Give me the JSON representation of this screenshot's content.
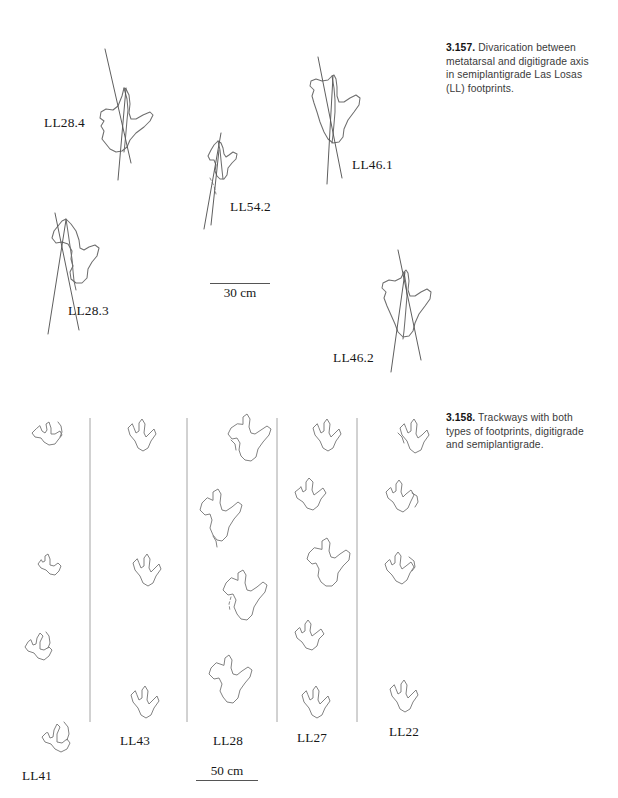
{
  "figure": {
    "caption_3157": {
      "number": "3.157.",
      "text": "Divarication between metatarsal and digitigrade axis in semiplantigrade Las Losas (LL) footprints."
    },
    "caption_3158": {
      "number": "3.158.",
      "text": "Trackways with both types of footprints, digitigrade and semiplantigrade."
    }
  },
  "panel_top": {
    "specimens": [
      {
        "label": "LL28.4",
        "x": 44,
        "y": 115
      },
      {
        "label": "LL28.3",
        "x": 68,
        "y": 303
      },
      {
        "label": "LL54.2",
        "x": 230,
        "y": 199
      },
      {
        "label": "LL46.1",
        "x": 352,
        "y": 157
      },
      {
        "label": "LL46.2",
        "x": 333,
        "y": 350
      }
    ],
    "scale": {
      "label": "30 cm",
      "x": 210,
      "y": 283,
      "width": 60
    }
  },
  "panel_bottom": {
    "trackways": [
      {
        "label": "LL41",
        "label_x": 22,
        "label_y": 768,
        "prints": 4
      },
      {
        "label": "LL43",
        "label_x": 120,
        "label_y": 733,
        "prints": 3
      },
      {
        "label": "LL28",
        "label_x": 213,
        "label_y": 733,
        "prints": 4
      },
      {
        "label": "LL27",
        "label_x": 297,
        "label_y": 730,
        "prints": 5
      },
      {
        "label": "LL22",
        "label_x": 389,
        "label_y": 724,
        "prints": 4
      }
    ],
    "dividers": [
      {
        "x": 90,
        "y1": 418,
        "y2": 722
      },
      {
        "x": 187,
        "y1": 418,
        "y2": 722
      },
      {
        "x": 277,
        "y1": 418,
        "y2": 722
      },
      {
        "x": 357,
        "y1": 418,
        "y2": 722
      }
    ],
    "scale": {
      "label": "50 cm",
      "x": 196,
      "y": 763,
      "width": 62
    }
  },
  "colors": {
    "background": "#ffffff",
    "outline": "#6e6e6e",
    "axis": "#555555",
    "divider": "#9a9a9a",
    "caption_text": "#3a3a3a",
    "label_text": "#171717"
  }
}
